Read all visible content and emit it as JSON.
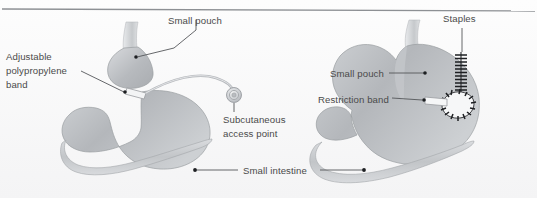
{
  "figure": {
    "background_color": "#fbfbfb",
    "top_rule_color": "#8d9094",
    "label_color": "#4a4a4a",
    "leader_color": "#55575a",
    "organ_fill": "#b9bcc0",
    "organ_fill_light": "#d6d8db",
    "organ_outline": "#9a9da1"
  },
  "panels": [
    {
      "id": "left-panel",
      "name": "adjustable-gastric-banding",
      "labels": [
        {
          "id": "small-pouch-left",
          "text": "Small pouch",
          "x": 168,
          "y": 24,
          "anchor": "start"
        },
        {
          "id": "adjustable-polypropylene-band",
          "text_lines": [
            "Adjustable",
            "polypropylene",
            "band"
          ],
          "x": 6,
          "y": 60,
          "anchor": "start"
        },
        {
          "id": "subcutaneous-access-point",
          "text_lines": [
            "Subcutaneous",
            "access point"
          ],
          "x": 223,
          "y": 115,
          "anchor": "start"
        }
      ]
    },
    {
      "id": "right-panel",
      "name": "vertical-banded-gastroplasty",
      "labels": [
        {
          "id": "staples",
          "text": "Staples",
          "x": 443,
          "y": 22,
          "anchor": "start"
        },
        {
          "id": "small-pouch-right",
          "text": "Small pouch",
          "x": 330,
          "y": 76,
          "anchor": "start"
        },
        {
          "id": "restriction-band",
          "text": "Restriction band",
          "x": 318,
          "y": 101,
          "anchor": "start"
        }
      ]
    }
  ],
  "shared_labels": [
    {
      "id": "small-intestine",
      "text": "Small intestine",
      "x": 243,
      "y": 173,
      "anchor": "start",
      "note": "leader lines extend to both the left and right diagrams"
    }
  ],
  "anatomy_parts": [
    "esophagus",
    "small-pouch",
    "stomach-body",
    "pylorus",
    "duodenum",
    "small-intestine",
    "gastric-band",
    "connecting-tubing",
    "access-port",
    "staple-line",
    "restriction-band-ring"
  ]
}
